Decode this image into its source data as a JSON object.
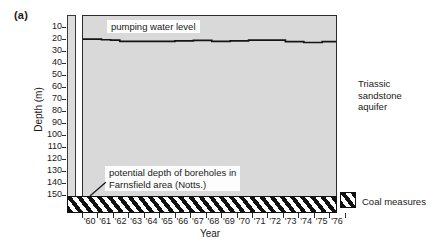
{
  "figure": {
    "panel_label": "(a)"
  },
  "axes": {
    "ylabel": "Depth (m)",
    "xlabel": "Year",
    "yticks": [
      10,
      20,
      30,
      40,
      50,
      60,
      70,
      80,
      90,
      100,
      110,
      120,
      130,
      140,
      150
    ],
    "xticklabels": [
      "60",
      "61",
      "62",
      "63",
      "64",
      "65",
      "66",
      "67",
      "68",
      "69",
      "70",
      "71",
      "72",
      "73",
      "74",
      "75",
      "76"
    ]
  },
  "annotations": {
    "pumping_level": "pumping water level",
    "borehole_line1": "potential depth of boreholes in",
    "borehole_line2": "Farnsfield area (Notts.)",
    "aquifer_line1": "Triassic",
    "aquifer_line2": "sandstone",
    "aquifer_line3": "aquifer",
    "coal_measures": "Coal measures"
  },
  "colors": {
    "plot_fill": "#d9d9d9",
    "line": "#151515",
    "frame": "#2b2b2b",
    "hatch": "#111111",
    "note_bg": "#fdfdfd"
  },
  "chart_data": {
    "type": "line",
    "title": "",
    "xlabel": "Year",
    "ylabel": "Depth (m)",
    "xlim": [
      "60",
      "76.5"
    ],
    "ylim": [
      0,
      155
    ],
    "y_inverted": true,
    "grid": false,
    "legend": "none",
    "series": [
      {
        "name": "pumping water level",
        "style": "step",
        "x": [
          "60.0",
          "60.6",
          "61.2",
          "61.8",
          "62.4",
          "63.0",
          "63.6",
          "64.2",
          "64.8",
          "65.4",
          "66.0",
          "66.6",
          "67.2",
          "67.8",
          "68.4",
          "69.0",
          "69.6",
          "70.2",
          "70.8",
          "71.4",
          "72.0",
          "72.6",
          "73.2",
          "73.8",
          "74.4",
          "75.0",
          "75.6",
          "76.2"
        ],
        "values": [
          19.5,
          19.5,
          20.0,
          20.3,
          21.3,
          21.3,
          21.3,
          21.3,
          21.3,
          21.3,
          21.0,
          21.0,
          20.6,
          20.6,
          21.3,
          21.3,
          21.0,
          21.0,
          20.3,
          20.3,
          20.3,
          20.3,
          21.6,
          21.6,
          22.3,
          22.3,
          21.6,
          21.6
        ]
      }
    ],
    "bands": [
      {
        "name": "Coal measures",
        "fill": "diagonal-hatch",
        "y_top": 146,
        "y_bottom": 153
      }
    ],
    "regions": [
      {
        "name": "Triassic sandstone aquifer",
        "fill": "#d9d9d9",
        "y_top": 0,
        "y_bottom": 146
      }
    ]
  }
}
